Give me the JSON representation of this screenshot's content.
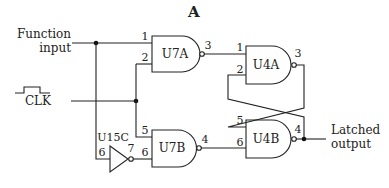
{
  "title": "A",
  "labels": {
    "function_input_line1": "Function",
    "function_input_line2": "input",
    "clk": "CLK",
    "latched_output_line1": "Latched",
    "latched_output_line2": "output"
  },
  "gates": {
    "u7a": {
      "name": "U7A",
      "type": "NAND",
      "pins": {
        "in1": "1",
        "in2": "2",
        "out": "3"
      }
    },
    "u7b": {
      "name": "U7B",
      "type": "NAND",
      "pins": {
        "in1": "5",
        "in2": "6",
        "out": "4"
      }
    },
    "u15c": {
      "name": "U15C",
      "type": "NOT",
      "pins": {
        "in": "6",
        "out": "7"
      }
    },
    "u4a": {
      "name": "U4A",
      "type": "NAND",
      "pins": {
        "in1": "1",
        "in2": "2",
        "out": "3"
      }
    },
    "u4b": {
      "name": "U4B",
      "type": "NAND",
      "pins": {
        "in1": "5",
        "in2": "6",
        "out": "4"
      }
    }
  }
}
